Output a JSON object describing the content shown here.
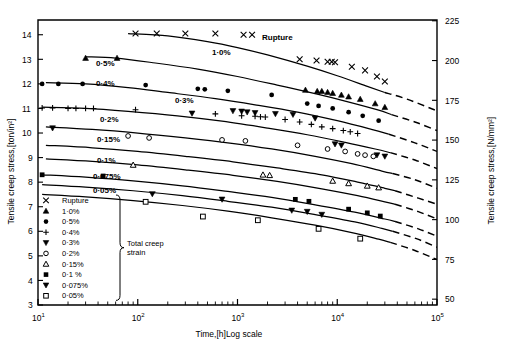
{
  "figure": {
    "title": "",
    "x_axis_label": "Time,[h]Log scale",
    "y_axis_left_label": "Tensile creep stress,[ton/in²]",
    "y_axis_right_label": "Tensile creep stress,[N/mm²]",
    "rupture_label": "Rupture",
    "legend_brace_label_line1": "Total creep",
    "legend_brace_label_line2": "strain"
  },
  "x_ticks": [
    {
      "value": 10,
      "label": "10",
      "exp": "1"
    },
    {
      "value": 100,
      "label": "10",
      "exp": "2"
    },
    {
      "value": 1000,
      "label": "10",
      "exp": "3"
    },
    {
      "value": 10000,
      "label": "10",
      "exp": "4"
    },
    {
      "value": 100000,
      "label": "10",
      "exp": "5"
    }
  ],
  "y_ticks_left": [
    "3",
    "4",
    "5",
    "6",
    "7",
    "8",
    "9",
    "10",
    "11",
    "12",
    "13",
    "14"
  ],
  "y_ticks_right": [
    "50",
    "75",
    "100",
    "125",
    "150",
    "175",
    "200",
    "225"
  ],
  "legend": {
    "items": [
      {
        "marker": "cross",
        "label": "Rupture"
      },
      {
        "marker": "triangle-up",
        "label": "1·0%"
      },
      {
        "marker": "circle-filled",
        "label": "0·5%"
      },
      {
        "marker": "plus",
        "label": "0·4%"
      },
      {
        "marker": "triangle-down",
        "label": "0·3%"
      },
      {
        "marker": "circle-open",
        "label": "0·2%"
      },
      {
        "marker": "triangle-up-open",
        "label": "0·15%"
      },
      {
        "marker": "square-filled",
        "label": "0·1 %"
      },
      {
        "marker": "triangle-down2",
        "label": "0·075%"
      },
      {
        "marker": "square-open",
        "label": "0·05%"
      }
    ]
  },
  "chart_data": {
    "type": "scatter",
    "title": "",
    "xlabel": "Time,[h]Log scale",
    "ylabel": "Tensile creep stress,[ton/in²]",
    "ylabel_secondary": "Tensile creep stress,[N/mm²]",
    "xscale": "log",
    "xlim": [
      10,
      100000
    ],
    "ylim": [
      3,
      14.6
    ],
    "ylim_secondary": [
      50,
      228
    ],
    "grid": false,
    "legend_position": "lower-left-inside",
    "unit_conversion_ton_per_in2_to_N_per_mm2": 15.4443,
    "series": [
      {
        "name": "Rupture",
        "marker": "cross",
        "curve_label": "Rupture",
        "curve_solid": [
          [
            80,
            14.05
          ],
          [
            200,
            13.95
          ],
          [
            500,
            13.72
          ],
          [
            1000,
            13.48
          ],
          [
            2000,
            13.18
          ],
          [
            5000,
            12.72
          ],
          [
            10000,
            12.33
          ],
          [
            20000,
            11.9
          ],
          [
            30000,
            11.65
          ]
        ],
        "curve_dashed": [
          [
            30000,
            11.65
          ],
          [
            50000,
            11.38
          ],
          [
            100000,
            10.9
          ]
        ],
        "points": [
          [
            95,
            14.05
          ],
          [
            155,
            14.05
          ],
          [
            300,
            14.05
          ],
          [
            600,
            14.05
          ],
          [
            1150,
            14.0
          ],
          [
            1400,
            14.0
          ],
          [
            4200,
            13.0
          ],
          [
            6200,
            12.95
          ],
          [
            8000,
            12.9
          ],
          [
            8800,
            12.9
          ],
          [
            9500,
            12.88
          ],
          [
            14000,
            12.7
          ],
          [
            19000,
            12.55
          ],
          [
            25000,
            12.3
          ],
          [
            30000,
            12.1
          ]
        ]
      },
      {
        "name": "1·0%",
        "marker": "triangle-up",
        "curve_label": "1·0%",
        "curve_solid": [
          [
            30,
            13.1
          ],
          [
            60,
            13.05
          ],
          [
            150,
            12.85
          ],
          [
            400,
            12.6
          ],
          [
            1000,
            12.3
          ],
          [
            2500,
            11.95
          ],
          [
            6000,
            11.6
          ],
          [
            12000,
            11.3
          ],
          [
            25000,
            10.95
          ],
          [
            35000,
            10.75
          ]
        ],
        "curve_dashed": [
          [
            35000,
            10.75
          ],
          [
            60000,
            10.45
          ],
          [
            100000,
            10.1
          ]
        ],
        "points": [
          [
            30,
            13.05
          ],
          [
            62,
            13.05
          ],
          [
            4800,
            11.75
          ],
          [
            6300,
            11.7
          ],
          [
            7000,
            11.7
          ],
          [
            8000,
            11.66
          ],
          [
            9000,
            11.62
          ],
          [
            11000,
            11.55
          ],
          [
            13000,
            11.48
          ],
          [
            17000,
            11.38
          ],
          [
            24000,
            11.2
          ],
          [
            30000,
            11.05
          ]
        ]
      },
      {
        "name": "0·5%",
        "marker": "circle-filled",
        "curve_label": "0·5%",
        "curve_solid": [
          [
            12,
            12.05
          ],
          [
            30,
            12.0
          ],
          [
            80,
            11.85
          ],
          [
            200,
            11.65
          ],
          [
            600,
            11.4
          ],
          [
            1500,
            11.15
          ],
          [
            4000,
            10.85
          ],
          [
            10000,
            10.5
          ],
          [
            22000,
            10.15
          ],
          [
            33000,
            9.95
          ]
        ],
        "curve_dashed": [
          [
            33000,
            9.95
          ],
          [
            60000,
            9.6
          ],
          [
            100000,
            9.25
          ]
        ],
        "points": [
          [
            11,
            12.0
          ],
          [
            16,
            12.0
          ],
          [
            28,
            12.0
          ],
          [
            120,
            11.95
          ],
          [
            400,
            11.8
          ],
          [
            470,
            11.78
          ],
          [
            800,
            11.72
          ],
          [
            2200,
            11.55
          ],
          [
            5000,
            11.2
          ],
          [
            6500,
            11.1
          ],
          [
            9000,
            11.0
          ],
          [
            13000,
            10.85
          ],
          [
            18000,
            10.7
          ],
          [
            26000,
            10.5
          ]
        ]
      },
      {
        "name": "0·4%",
        "marker": "plus",
        "curve_label": "0·4%",
        "curve_solid": [
          [
            11,
            11.05
          ],
          [
            30,
            11.0
          ],
          [
            80,
            10.88
          ],
          [
            250,
            10.7
          ],
          [
            700,
            10.48
          ],
          [
            2000,
            10.2
          ],
          [
            5000,
            9.93
          ],
          [
            12000,
            9.62
          ],
          [
            24000,
            9.35
          ],
          [
            34000,
            9.2
          ]
        ],
        "curve_dashed": [
          [
            34000,
            9.2
          ],
          [
            60000,
            8.9
          ],
          [
            100000,
            8.55
          ]
        ],
        "points": [
          [
            11,
            11.02
          ],
          [
            14,
            11.02
          ],
          [
            20,
            11.0
          ],
          [
            24,
            11.0
          ],
          [
            30,
            11.0
          ],
          [
            36,
            11.0
          ],
          [
            95,
            10.95
          ],
          [
            600,
            10.78
          ],
          [
            1100,
            10.7
          ],
          [
            1500,
            10.68
          ],
          [
            1700,
            10.66
          ],
          [
            1900,
            10.65
          ],
          [
            3000,
            10.55
          ],
          [
            4200,
            10.45
          ],
          [
            5500,
            10.35
          ],
          [
            7000,
            10.25
          ],
          [
            9000,
            10.18
          ],
          [
            11500,
            10.1
          ],
          [
            13500,
            10.05
          ],
          [
            16000,
            9.98
          ]
        ]
      },
      {
        "name": "0·3%",
        "marker": "triangle-down",
        "curve_label": "0·3%",
        "curve_solid": [
          [
            12,
            10.25
          ],
          [
            35,
            10.15
          ],
          [
            100,
            10.0
          ],
          [
            300,
            9.8
          ],
          [
            800,
            9.6
          ],
          [
            2200,
            9.35
          ],
          [
            6000,
            9.05
          ],
          [
            14000,
            8.75
          ],
          [
            28000,
            8.45
          ],
          [
            36000,
            8.35
          ]
        ],
        "curve_dashed": [
          [
            36000,
            8.35
          ],
          [
            60000,
            8.1
          ],
          [
            100000,
            7.75
          ]
        ],
        "points": [
          [
            14,
            10.2
          ],
          [
            350,
            10.8
          ],
          [
            900,
            10.9
          ],
          [
            1100,
            10.88
          ],
          [
            1250,
            10.85
          ],
          [
            1500,
            10.82
          ],
          [
            2400,
            10.78
          ],
          [
            3600,
            10.75
          ],
          [
            6000,
            10.6
          ],
          [
            9500,
            9.55
          ],
          [
            11000,
            9.5
          ],
          [
            25000,
            9.1
          ],
          [
            30000,
            9.05
          ]
        ]
      },
      {
        "name": "0·2%",
        "marker": "circle-open",
        "curve_label": "0·2%",
        "curve_solid": [
          [
            12,
            9.5
          ],
          [
            35,
            9.4
          ],
          [
            100,
            9.25
          ],
          [
            300,
            9.05
          ],
          [
            900,
            8.83
          ],
          [
            2500,
            8.58
          ],
          [
            7000,
            8.3
          ],
          [
            16000,
            8.0
          ],
          [
            30000,
            7.75
          ],
          [
            38000,
            7.65
          ]
        ],
        "curve_dashed": [
          [
            38000,
            7.65
          ],
          [
            65000,
            7.35
          ],
          [
            100000,
            7.1
          ]
        ],
        "points": [
          [
            80,
            9.88
          ],
          [
            130,
            9.8
          ],
          [
            700,
            9.72
          ],
          [
            1200,
            9.68
          ],
          [
            4000,
            9.5
          ],
          [
            8000,
            9.35
          ],
          [
            12000,
            9.25
          ],
          [
            16000,
            9.15
          ],
          [
            19000,
            9.1
          ],
          [
            23000,
            9.05
          ]
        ]
      },
      {
        "name": "0·15%",
        "marker": "triangle-up-open",
        "curve_label": "0·15%",
        "curve_solid": [
          [
            12,
            8.95
          ],
          [
            35,
            8.85
          ],
          [
            100,
            8.7
          ],
          [
            300,
            8.5
          ],
          [
            900,
            8.28
          ],
          [
            2500,
            8.03
          ],
          [
            7000,
            7.73
          ],
          [
            16000,
            7.45
          ],
          [
            30000,
            7.2
          ],
          [
            38000,
            7.1
          ]
        ],
        "curve_dashed": [
          [
            38000,
            7.1
          ],
          [
            65000,
            6.8
          ],
          [
            100000,
            6.5
          ]
        ],
        "points": [
          [
            90,
            8.7
          ],
          [
            1800,
            8.3
          ],
          [
            2100,
            8.28
          ],
          [
            9000,
            8.05
          ],
          [
            13000,
            7.95
          ],
          [
            20000,
            7.85
          ],
          [
            26000,
            7.78
          ]
        ]
      },
      {
        "name": "0·1 %",
        "marker": "square-filled",
        "curve_label": "0·1%",
        "curve_solid": [
          [
            11,
            8.3
          ],
          [
            30,
            8.2
          ],
          [
            90,
            8.05
          ],
          [
            280,
            7.85
          ],
          [
            800,
            7.62
          ],
          [
            2200,
            7.38
          ],
          [
            6000,
            7.08
          ],
          [
            15000,
            6.78
          ],
          [
            30000,
            6.5
          ],
          [
            38000,
            6.4
          ]
        ],
        "curve_dashed": [
          [
            38000,
            6.4
          ],
          [
            65000,
            6.1
          ],
          [
            100000,
            5.8
          ]
        ],
        "points": [
          [
            11,
            8.3
          ],
          [
            45,
            8.25
          ],
          [
            3800,
            7.3
          ],
          [
            5200,
            7.22
          ],
          [
            13000,
            6.9
          ],
          [
            20000,
            6.75
          ],
          [
            27000,
            6.62
          ]
        ]
      },
      {
        "name": "0·075%",
        "marker": "triangle-down2",
        "curve_label": "0·075%",
        "curve_solid": [
          [
            11,
            7.9
          ],
          [
            30,
            7.8
          ],
          [
            90,
            7.65
          ],
          [
            280,
            7.45
          ],
          [
            800,
            7.22
          ],
          [
            2200,
            6.98
          ],
          [
            6000,
            6.68
          ],
          [
            15000,
            6.38
          ],
          [
            28000,
            6.12
          ],
          [
            36000,
            6.0
          ]
        ],
        "curve_dashed": [
          [
            36000,
            6.0
          ],
          [
            62000,
            5.7
          ],
          [
            100000,
            5.35
          ]
        ],
        "points": [
          [
            140,
            7.52
          ],
          [
            700,
            7.3
          ],
          [
            3500,
            6.85
          ],
          [
            5000,
            6.8
          ],
          [
            7000,
            6.68
          ]
        ]
      },
      {
        "name": "0·05%",
        "marker": "square-open",
        "curve_label": "0·05%",
        "curve_solid": [
          [
            11,
            7.5
          ],
          [
            30,
            7.4
          ],
          [
            90,
            7.25
          ],
          [
            280,
            7.05
          ],
          [
            800,
            6.82
          ],
          [
            2200,
            6.55
          ],
          [
            6000,
            6.25
          ],
          [
            14000,
            5.95
          ],
          [
            26000,
            5.68
          ],
          [
            34000,
            5.55
          ]
        ],
        "curve_dashed": [
          [
            34000,
            5.55
          ],
          [
            60000,
            5.22
          ],
          [
            100000,
            4.85
          ]
        ],
        "points": [
          [
            120,
            7.2
          ],
          [
            450,
            6.6
          ],
          [
            1600,
            6.45
          ],
          [
            6500,
            6.1
          ],
          [
            17000,
            5.7
          ]
        ]
      }
    ]
  }
}
